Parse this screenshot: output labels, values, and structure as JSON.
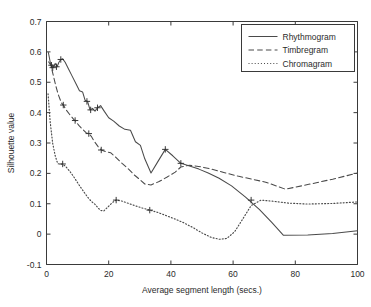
{
  "chart_data": {
    "type": "line",
    "title": "",
    "xlabel": "Average segment length (secs.)",
    "ylabel": "Silhouette value",
    "xlim": [
      0,
      100
    ],
    "ylim": [
      -0.1,
      0.7
    ],
    "xticks": [
      "0",
      "20",
      "40",
      "60",
      "80",
      "100"
    ],
    "xtick_values": [
      0,
      20,
      40,
      60,
      80,
      100
    ],
    "yticks": [
      "-0.1",
      "0",
      "0.1",
      "0.2",
      "0.3",
      "0.4",
      "0.5",
      "0.6",
      "0.7"
    ],
    "ytick_values": [
      -0.1,
      0,
      0.1,
      0.2,
      0.3,
      0.4,
      0.5,
      0.6,
      0.7
    ],
    "grid": false,
    "legend_position": "top-right",
    "series": [
      {
        "name": "Rhythmogram",
        "style": "solid",
        "color": "#4a4a4a",
        "x": [
          0.6,
          1.4,
          2.1,
          2.8,
          3.4,
          4.0,
          4.6,
          5.2,
          6.0,
          7.0,
          8.2,
          9.4,
          10.6,
          11.6,
          12.4,
          13.2,
          14.0,
          14.8,
          15.6,
          16.4,
          17.4,
          18.6,
          20.0,
          21.6,
          23.4,
          25.2,
          27.0,
          28.6,
          30.2,
          31.6,
          33.6,
          36.0,
          38.2,
          40.6,
          43.2,
          46.0,
          49.0,
          52.0,
          55.5,
          59.5,
          64.0,
          68.5,
          72.5,
          76.2,
          84.0,
          92.0,
          100.0
        ],
        "y": [
          0.598,
          0.556,
          0.548,
          0.562,
          0.551,
          0.566,
          0.575,
          0.577,
          0.566,
          0.545,
          0.521,
          0.497,
          0.472,
          0.468,
          0.441,
          0.437,
          0.409,
          0.414,
          0.405,
          0.416,
          0.423,
          0.404,
          0.383,
          0.372,
          0.356,
          0.345,
          0.342,
          0.304,
          0.292,
          0.248,
          0.201,
          0.242,
          0.279,
          0.258,
          0.233,
          0.224,
          0.214,
          0.201,
          0.184,
          0.159,
          0.122,
          0.081,
          0.038,
          -0.004,
          -0.003,
          0.002,
          0.011
        ],
        "markers_x": [
          2.0,
          3.2,
          4.6,
          13.0,
          14.2,
          16.4,
          38.2,
          43.2
        ],
        "markers_y": [
          0.548,
          0.551,
          0.575,
          0.437,
          0.409,
          0.416,
          0.279,
          0.233
        ]
      },
      {
        "name": "Timbregram",
        "style": "dashed",
        "color": "#4a4a4a",
        "x": [
          0.7,
          1.4,
          2.2,
          3.0,
          3.8,
          4.8,
          5.4,
          6.4,
          7.6,
          8.8,
          9.2,
          10.4,
          11.6,
          12.8,
          13.6,
          14.4,
          15.4,
          16.6,
          17.6,
          19.0,
          20.6,
          22.4,
          24.4,
          26.4,
          28.2,
          30.2,
          31.6,
          33.6,
          36.2,
          38.8,
          41.4,
          43.2,
          46.0,
          49.5,
          53.0,
          57.0,
          61.5,
          66.0,
          70.5,
          76.8,
          84.0,
          92.0,
          100.0
        ],
        "y": [
          0.567,
          0.556,
          0.522,
          0.488,
          0.459,
          0.432,
          0.425,
          0.408,
          0.392,
          0.377,
          0.374,
          0.358,
          0.345,
          0.333,
          0.331,
          0.322,
          0.305,
          0.288,
          0.277,
          0.272,
          0.268,
          0.252,
          0.232,
          0.214,
          0.195,
          0.178,
          0.165,
          0.162,
          0.173,
          0.188,
          0.204,
          0.221,
          0.227,
          0.222,
          0.214,
          0.203,
          0.191,
          0.181,
          0.171,
          0.148,
          0.163,
          0.181,
          0.201
        ],
        "markers_x": [
          1.6,
          5.4,
          9.2,
          13.6,
          17.6
        ],
        "markers_y": [
          0.556,
          0.425,
          0.374,
          0.331,
          0.277
        ]
      },
      {
        "name": "Chromagram",
        "style": "dotted",
        "color": "#8a8a8a",
        "x": [
          0.5,
          1.2,
          2.0,
          2.8,
          3.6,
          4.4,
          5.2,
          6.2,
          7.4,
          8.8,
          10.2,
          11.8,
          13.2,
          14.4,
          15.6,
          16.6,
          17.4,
          18.4,
          19.6,
          21.2,
          22.4,
          24.2,
          26.4,
          28.6,
          30.8,
          33.2,
          35.6,
          38.2,
          41.0,
          44.0,
          47.0,
          50.0,
          53.0,
          55.6,
          58.0,
          60.5,
          63.0,
          65.8,
          69.0,
          73.0,
          78.0,
          84.0,
          92.0,
          100.0
        ],
        "y": [
          0.462,
          0.368,
          0.298,
          0.258,
          0.232,
          0.23,
          0.231,
          0.222,
          0.208,
          0.188,
          0.166,
          0.142,
          0.122,
          0.108,
          0.098,
          0.086,
          0.078,
          0.076,
          0.088,
          0.104,
          0.112,
          0.109,
          0.101,
          0.093,
          0.086,
          0.079,
          0.072,
          0.062,
          0.051,
          0.038,
          0.022,
          0.004,
          -0.011,
          -0.017,
          -0.014,
          0.008,
          0.048,
          0.094,
          0.112,
          0.108,
          0.102,
          0.099,
          0.101,
          0.106
        ],
        "markers_x": [
          5.2,
          22.4,
          33.2,
          65.8
        ],
        "markers_y": [
          0.231,
          0.112,
          0.079,
          0.112
        ]
      }
    ],
    "legend": [
      {
        "label": "Rhythmogram",
        "style": "solid"
      },
      {
        "label": "Timbregram",
        "style": "dashed"
      },
      {
        "label": "Chromagram",
        "style": "dotted"
      }
    ]
  }
}
